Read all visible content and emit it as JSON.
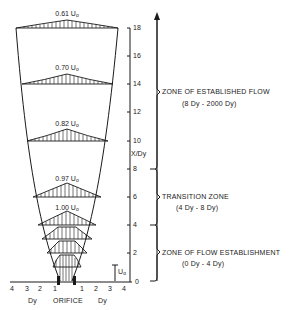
{
  "diagram": {
    "type": "jet-flow-velocity-profiles",
    "y_axis": {
      "label": "X/Dy",
      "ticks": [
        "0",
        "2",
        "4",
        "6",
        "8",
        "10",
        "12",
        "14",
        "16",
        "18"
      ]
    },
    "x_axis": {
      "left_ticks": [
        "4",
        "3",
        "2",
        "1"
      ],
      "right_ticks": [
        "1",
        "2",
        "3",
        "4"
      ],
      "left_unit": "Dy",
      "right_unit": "Dy",
      "center_label": "ORIFICE"
    },
    "velocity_labels": [
      {
        "value": "0.61",
        "unit": "U",
        "sub": "o",
        "x_dy": 18
      },
      {
        "value": "0.70",
        "unit": "U",
        "sub": "o",
        "x_dy": 14
      },
      {
        "value": "0.82",
        "unit": "U",
        "sub": "o",
        "x_dy": 10
      },
      {
        "value": "0.97",
        "unit": "U",
        "sub": "o",
        "x_dy": 6
      },
      {
        "value": "1.00",
        "unit": "U",
        "sub": "o",
        "x_dy": 4
      }
    ],
    "initial_velocity": {
      "unit": "U",
      "sub": "o"
    },
    "zones": [
      {
        "name": "ZONE OF ESTABLISHED FLOW",
        "range": "(8 Dy - 2000 Dy)"
      },
      {
        "name": "TRANSITION ZONE",
        "range": "(4 Dy - 8 Dy)"
      },
      {
        "name": "ZONE OF FLOW ESTABLISHMENT",
        "range": "(0 Dy - 4 Dy)"
      }
    ]
  }
}
